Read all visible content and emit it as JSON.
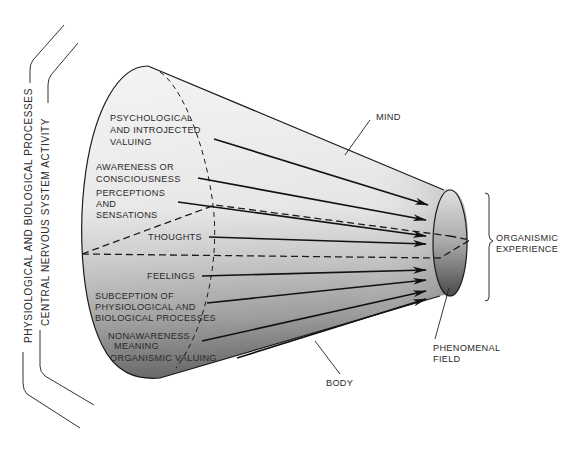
{
  "diagram": {
    "type": "cone-diagram",
    "left_brackets": {
      "outer": "PHYSIOLOGICAL AND BIOLOGICAL PROCESSES",
      "inner": "CENTRAL NERVOUS SYSTEM ACTIVITY"
    },
    "cone_labels": {
      "mind": "MIND",
      "body": "BODY",
      "phenomenal_field": [
        "PHENOMENAL",
        "FIELD"
      ],
      "organismic_experience": [
        "ORGANISMIC",
        "EXPERIENCE"
      ]
    },
    "arrows": [
      {
        "id": "psychological-valuing",
        "lines": [
          "PSYCHOLOGICAL",
          "AND INTROJECTED",
          "VALUING"
        ]
      },
      {
        "id": "awareness",
        "lines": [
          "AWARENESS OR",
          "CONSCIOUSNESS"
        ]
      },
      {
        "id": "perceptions",
        "lines": [
          "PERCEPTIONS",
          "AND",
          "SENSATIONS"
        ]
      },
      {
        "id": "thoughts",
        "lines": [
          "THOUGHTS"
        ]
      },
      {
        "id": "feelings",
        "lines": [
          "FEELINGS"
        ]
      },
      {
        "id": "subception",
        "lines": [
          "SUBCEPTION OF",
          "PHYSIOLOGICAL AND",
          "BIOLOGICAL PROCESSES"
        ]
      },
      {
        "id": "nonawareness",
        "lines": [
          "NONAWARENESS",
          "MEANING"
        ]
      },
      {
        "id": "organismic-valuing",
        "lines": [
          "ORGANISMIC VALUING"
        ]
      }
    ],
    "colors": {
      "line": "#1c1c1c",
      "shade_light": "#f4f4f4",
      "shade_dark": "#5a5a5a",
      "text": "#2a2a2a"
    }
  }
}
